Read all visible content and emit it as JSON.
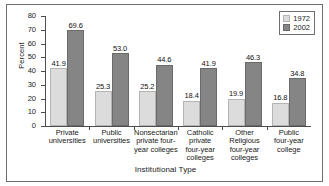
{
  "chart_data": {
    "type": "bar",
    "title": "",
    "xlabel": "Institutional Type",
    "ylabel": "Percent",
    "ylim": [
      0,
      80
    ],
    "yticks": [
      0,
      10,
      20,
      30,
      40,
      50,
      60,
      70,
      80
    ],
    "grid": false,
    "legend_position": "top-right",
    "categories": [
      "Private universities",
      "Public universities",
      "Nonsectarian private four-year colleges",
      "Catholic private four-year colleges",
      "Other Religious four-year colleges",
      "Public four-year college"
    ],
    "category_lines": [
      [
        "Private",
        "universities"
      ],
      [
        "Public",
        "universities"
      ],
      [
        "Nonsectarian",
        "private four-",
        "year colleges"
      ],
      [
        "Catholic",
        "private",
        "four-year",
        "colleges"
      ],
      [
        "Other",
        "Religious",
        "four-year",
        "colleges"
      ],
      [
        "Public",
        "four-year",
        "college"
      ]
    ],
    "series": [
      {
        "name": "1972",
        "color": "#dcdcdc",
        "values": [
          41.9,
          25.3,
          25.2,
          18.4,
          19.9,
          16.8
        ],
        "labels": [
          "41.9",
          "25.3",
          "25.2",
          "18.4",
          "19.9",
          "16.8"
        ]
      },
      {
        "name": "2002",
        "color": "#858585",
        "values": [
          69.6,
          53.0,
          44.6,
          41.9,
          46.3,
          34.8
        ],
        "labels": [
          "69.6",
          "53.0",
          "44.6",
          "41.9",
          "46.3",
          "34.8"
        ]
      }
    ]
  },
  "legend": {
    "entries": [
      {
        "label": "1972"
      },
      {
        "label": "2002"
      }
    ]
  }
}
